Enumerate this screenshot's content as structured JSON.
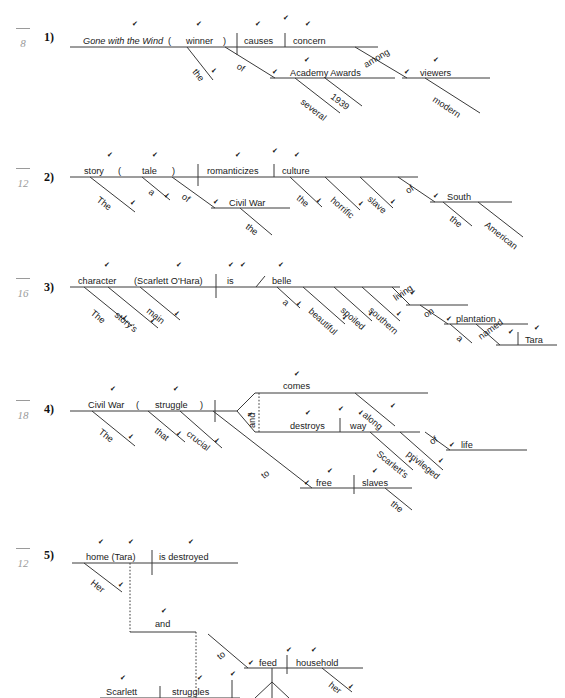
{
  "meta": {
    "doc_type": "sentence-diagramming-worksheet",
    "check_glyph": "✔",
    "ink_color": "#3a3a3a",
    "score_color": "#9a9a9a"
  },
  "problems": [
    {
      "number": "1)",
      "score_denominator": "8",
      "words": {
        "subject": "Gone with the Wind",
        "appositive_open": "(",
        "appositive": "winner",
        "appositive_close": ")",
        "verb": "causes",
        "object": "concern",
        "the1": "the",
        "of1": "of",
        "obj_of_prep1": "Academy Awards",
        "several": "several",
        "year": "1939",
        "among": "among",
        "obj_of_prep2": "viewers",
        "modern": "modern"
      }
    },
    {
      "number": "2)",
      "score_denominator": "12",
      "words": {
        "subject": "story",
        "appositive_open": "(",
        "appositive": "tale",
        "appositive_close": ")",
        "verb": "romanticizes",
        "object": "culture",
        "the1": "The",
        "a1": "a",
        "of1": "of",
        "obj_of_prep1": "Civil War",
        "the2": "the",
        "the3": "the",
        "horrific": "horrific",
        "slave": "slave",
        "of2": "of",
        "obj_of_prep2": "South",
        "the4": "the",
        "american": "American"
      }
    },
    {
      "number": "3)",
      "score_denominator": "16",
      "words": {
        "subject": "character",
        "appositive": "(Scarlett O'Hara)",
        "verb": "is",
        "complement": "belle",
        "the1": "The",
        "storys": "story's",
        "main": "main",
        "a1": "a",
        "beautiful": "beautiful",
        "spoiled": "spoiled",
        "southern": "southern",
        "living": "living",
        "on": "on",
        "obj_of_prep1": "plantation",
        "a2": "a",
        "named": "named",
        "obj_complement": "Tara"
      }
    },
    {
      "number": "4)",
      "score_denominator": "18",
      "words": {
        "subject": "Civil War",
        "appositive_open": "(",
        "appositive": "struggle",
        "appositive_close": ")",
        "the1": "The",
        "that": "that",
        "crucial": "crucial",
        "conjunction": "and",
        "verb1": "comes",
        "verb2": "destroys",
        "object2": "way",
        "along": "along",
        "scarletts": "Scarlett's",
        "privileged": "privileged",
        "of1": "of",
        "obj_of_prep1": "life",
        "to": "to",
        "infinitive": "free",
        "inf_object": "slaves",
        "the2": "the"
      }
    },
    {
      "number": "5)",
      "score_denominator": "12",
      "words": {
        "subject1": "home (Tara)",
        "verb1": "is destroyed",
        "her1": "Her",
        "conjunction": "and",
        "subject2": "Scarlett",
        "verb2": "struggles",
        "to": "to",
        "infinitive": "feed",
        "inf_object": "household",
        "her2": "her"
      }
    }
  ]
}
